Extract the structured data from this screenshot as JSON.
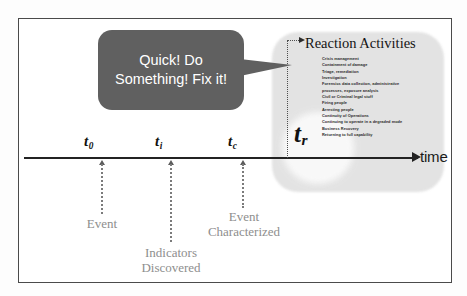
{
  "figure": {
    "axis": {
      "label": "time"
    },
    "colors": {
      "bubble_fill": "#606060",
      "bubble_text": "#ffffff",
      "caption_text": "#8e8e8e",
      "axis": "#232323",
      "region_fill": "#e2e2e2",
      "frame_border": "#4a4a4a"
    }
  },
  "speech_bubble": {
    "line1": "Quick!  Do",
    "line2": "Something! Fix it!",
    "text": "Quick!  Do Something! Fix it!"
  },
  "timeline": {
    "points": [
      {
        "id": "t0",
        "symbol": "t",
        "subscript": "0",
        "caption_line1": "Event",
        "caption_line2": ""
      },
      {
        "id": "ti",
        "symbol": "t",
        "subscript": "i",
        "caption_line1": "Indicators",
        "caption_line2": "Discovered"
      },
      {
        "id": "tc",
        "symbol": "t",
        "subscript": "c",
        "caption_line1": "Event",
        "caption_line2": "Characterized"
      },
      {
        "id": "tr",
        "symbol": "t",
        "subscript": "r",
        "caption_line1": "",
        "caption_line2": ""
      }
    ]
  },
  "reaction": {
    "title": "Reaction Activities",
    "activities": [
      "Crisis management",
      "Containment of damage",
      "Triage, remediation",
      "Investigation",
      "Forensics data collection, administrative",
      "processes, exposure analysis",
      "Civil or Criminal legal stuff",
      "Firing people",
      "Arresting people",
      "Continuity of Operations",
      "Continuing to operate in a degraded mode",
      "Business Recovery",
      "Returning to full capability"
    ]
  }
}
